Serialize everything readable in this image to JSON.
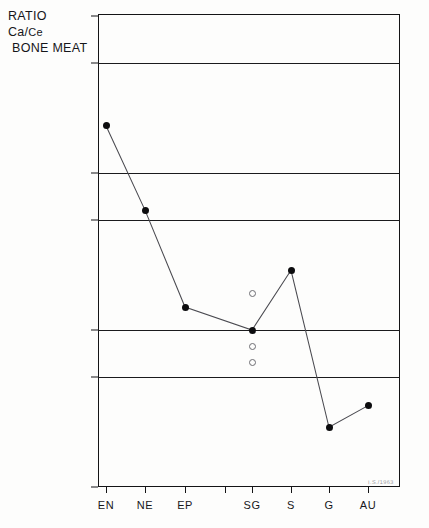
{
  "title": {
    "line1": "RATIO",
    "line2_numerator": "Ca/",
    "line2_denominator": "Ce",
    "line3": "BONE MEAT"
  },
  "annotation": {
    "scan_note": "I.S./1963"
  },
  "chart_data": {
    "type": "line",
    "title": "RATIO Ca/Ce BONE MEAT",
    "xlabel": "",
    "ylabel": "RATIO Ca/Ce BONE MEAT",
    "yscale": "log",
    "ylim": [
      0.1,
      100.0
    ],
    "grid": true,
    "legend": "none",
    "ytick_labels": [
      "100·0",
      "50·0",
      "10·0",
      "5·0",
      "1·0",
      "0·5",
      "0·1"
    ],
    "ytick_values": [
      100.0,
      50.0,
      10.0,
      5.0,
      1.0,
      0.5,
      0.1
    ],
    "categories": [
      "EN",
      "NE",
      "EP",
      "",
      "SG",
      "S",
      "G",
      "AU"
    ],
    "series": [
      {
        "name": "Ca/Ce ratio",
        "marker": "filled-circle",
        "connected": true,
        "points": [
          {
            "x": "EN",
            "value": 20.0
          },
          {
            "x": "NE",
            "value": 5.8
          },
          {
            "x": "EP",
            "value": 1.4
          },
          {
            "x": "SG",
            "value": 1.0
          },
          {
            "x": "S",
            "value": 2.4
          },
          {
            "x": "G",
            "value": 0.24
          },
          {
            "x": "AU",
            "value": 0.33
          }
        ]
      },
      {
        "name": "Individual values",
        "marker": "open-circle",
        "connected": false,
        "points": [
          {
            "x": "SG",
            "value": 1.7
          },
          {
            "x": "SG",
            "value": 0.78
          },
          {
            "x": "SG",
            "value": 0.62
          }
        ]
      }
    ]
  }
}
